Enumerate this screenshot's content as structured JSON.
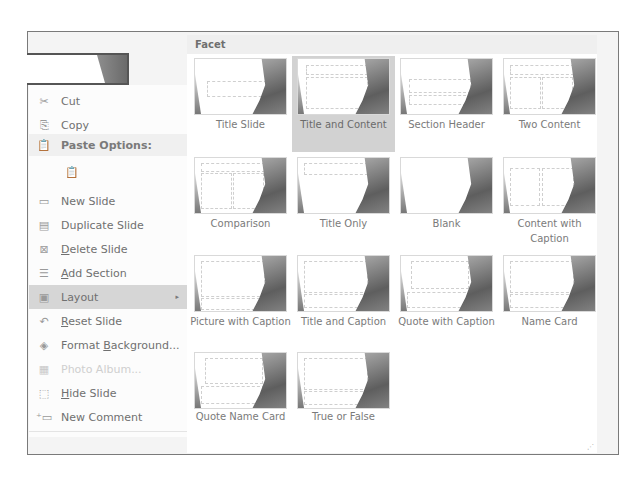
{
  "context_menu": {
    "items": [
      {
        "label": "Cut",
        "icon": "scissors-icon",
        "state": "normal",
        "underline": "t"
      },
      {
        "label": "Copy",
        "icon": "copy-icon",
        "state": "normal"
      },
      {
        "label": "Paste Options:",
        "icon": "paste-icon",
        "state": "header"
      },
      {
        "label": "",
        "icon": "paste-keep-formatting-icon",
        "state": "disabled"
      },
      {
        "label": "New Slide",
        "icon": "new-slide-icon",
        "state": "normal"
      },
      {
        "label": "Duplicate Slide",
        "icon": "duplicate-slide-icon",
        "state": "normal"
      },
      {
        "label": "Delete Slide",
        "icon": "delete-slide-icon",
        "state": "normal"
      },
      {
        "label": "Add Section",
        "icon": "add-section-icon",
        "state": "normal"
      },
      {
        "label": "Layout",
        "icon": "layout-icon",
        "state": "highlighted",
        "submenu": "▸"
      },
      {
        "label": "Reset Slide",
        "icon": "reset-slide-icon",
        "state": "normal"
      },
      {
        "label": "Format Background...",
        "icon": "format-background-icon",
        "state": "normal"
      },
      {
        "label": "Photo Album...",
        "icon": "photo-album-icon",
        "state": "disabled"
      },
      {
        "label": "Hide Slide",
        "icon": "hide-slide-icon",
        "state": "normal"
      },
      {
        "label": "New Comment",
        "icon": "new-comment-icon",
        "state": "normal"
      }
    ]
  },
  "layout_gallery": {
    "theme_name": "Facet",
    "layouts": [
      {
        "label": "Title Slide",
        "selected": false
      },
      {
        "label": "Title and Content",
        "selected": true
      },
      {
        "label": "Section Header",
        "selected": false
      },
      {
        "label": "Two Content",
        "selected": false
      },
      {
        "label": "Comparison",
        "selected": false
      },
      {
        "label": "Title Only",
        "selected": false
      },
      {
        "label": "Blank",
        "selected": false
      },
      {
        "label": "Content with Caption",
        "selected": false
      },
      {
        "label": "Picture with Caption",
        "selected": false
      },
      {
        "label": "Title and Caption",
        "selected": false
      },
      {
        "label": "Quote with Caption",
        "selected": false
      },
      {
        "label": "Name Card",
        "selected": false
      },
      {
        "label": "Quote Name Card",
        "selected": false
      },
      {
        "label": "True or False",
        "selected": false
      }
    ]
  },
  "colors": {
    "highlight": "#d6d6d6",
    "selected_tile": "#d2d2d2",
    "header_bg": "#efefef"
  }
}
